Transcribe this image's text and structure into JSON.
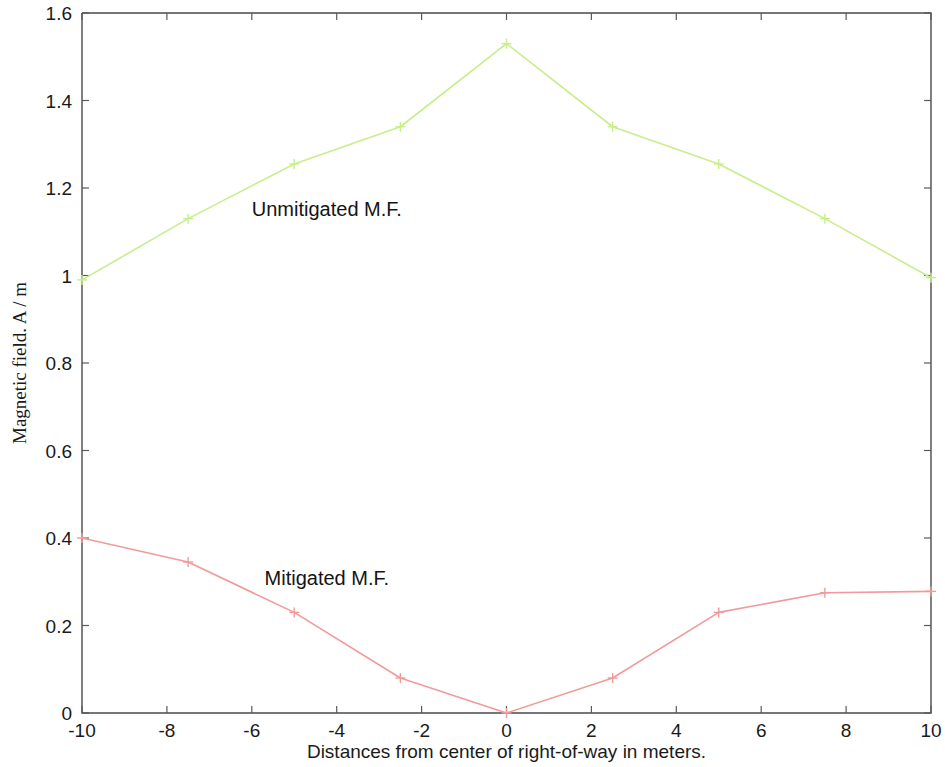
{
  "chart_data": {
    "type": "line",
    "title": "",
    "xlabel": "Distances from center of right-of-way in meters.",
    "ylabel": "Magnetic field. A / m",
    "xlim": [
      -10,
      10
    ],
    "ylim": [
      0,
      1.6
    ],
    "grid": false,
    "legend_position": "inline-annotation",
    "x_ticks": [
      -10,
      -8,
      -6,
      -4,
      -2,
      0,
      2,
      4,
      6,
      8,
      10
    ],
    "x_tick_labels": [
      "-10",
      "-8",
      "-6",
      "-4",
      "-2",
      "0",
      "2",
      "4",
      "6",
      "8",
      "10"
    ],
    "y_ticks": [
      0,
      0.2,
      0.4,
      0.6,
      0.8,
      1,
      1.2,
      1.4,
      1.6
    ],
    "y_tick_labels": [
      "0",
      "0.2",
      "0.4",
      "0.6",
      "0.8",
      "1",
      "1.2",
      "1.4",
      "1.6"
    ],
    "x": [
      -10,
      -7.5,
      -5,
      -2.5,
      0,
      2.5,
      5,
      7.5,
      10
    ],
    "series": [
      {
        "name": "Unmitigated M.F.",
        "color": "#c8ee8c",
        "marker": "plus",
        "values": [
          0.99,
          1.13,
          1.255,
          1.34,
          1.53,
          1.34,
          1.255,
          1.13,
          0.995
        ]
      },
      {
        "name": "Mitigated M.F.",
        "color": "#f19a9a",
        "marker": "plus",
        "values": [
          0.4,
          0.345,
          0.23,
          0.08,
          0.0,
          0.08,
          0.23,
          0.275,
          0.278
        ]
      }
    ],
    "annotations": [
      {
        "text": "Unmitigated M.F.",
        "x": -6.0,
        "y": 1.135,
        "series": "Unmitigated M.F."
      },
      {
        "text": "Mitigated M.F.",
        "x": -5.7,
        "y": 0.292,
        "series": "Mitigated M.F."
      }
    ]
  }
}
